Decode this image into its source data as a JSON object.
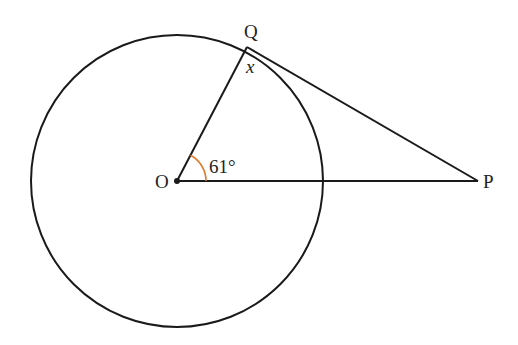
{
  "diagram": {
    "type": "circle-tangent",
    "points": {
      "O": {
        "label": "O"
      },
      "Q": {
        "label": "Q"
      },
      "P": {
        "label": "P"
      }
    },
    "angle_label": "61°",
    "unknown_label": "x",
    "colors": {
      "line": "#1a1a1a",
      "angle_arc": "#e07a2e",
      "text": "#222222"
    }
  }
}
